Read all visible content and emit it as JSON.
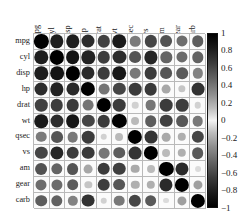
{
  "chart_data": {
    "type": "heatmap",
    "title": "",
    "subtitle": "",
    "xlabel": "",
    "ylabel": "",
    "grid": true,
    "legend_position": "right",
    "style": "corrplot-circle-grayscale",
    "note": "Correlation matrix of the mtcars variables. Circle area and darkness encode absolute correlation; the gray scale is symmetric so that both +1 and -1 render black and 0 renders near-white.",
    "categories": [
      "mpg",
      "cyl",
      "disp",
      "hp",
      "drat",
      "wt",
      "qsec",
      "vs",
      "am",
      "gear",
      "carb"
    ],
    "x_tick_labels": [
      "mpg",
      "cyl",
      "disp",
      "hp",
      "drat",
      "wt",
      "qsec",
      "vs",
      "am",
      "gear",
      "carb"
    ],
    "y_tick_labels": [
      "mpg",
      "cyl",
      "disp",
      "hp",
      "drat",
      "wt",
      "qsec",
      "vs",
      "am",
      "gear",
      "carb"
    ],
    "zlim": [
      -1,
      1
    ],
    "colorbar": {
      "ticks": [
        "1",
        "0.8",
        "0.6",
        "0.4",
        "0.2",
        "0",
        "−0.2",
        "−0.4",
        "−0.6",
        "−0.8",
        "−1"
      ],
      "tick_values": [
        1,
        0.8,
        0.6,
        0.4,
        0.2,
        0,
        -0.2,
        -0.4,
        -0.6,
        -0.8,
        -1
      ],
      "top_color": "#000000",
      "mid_color": "#f2f2f2",
      "bottom_color": "#000000"
    },
    "matrix": [
      [
        1.0,
        -0.85,
        -0.85,
        -0.78,
        0.68,
        -0.87,
        0.42,
        0.66,
        0.6,
        0.48,
        -0.55
      ],
      [
        -0.85,
        1.0,
        0.9,
        0.83,
        -0.7,
        0.78,
        -0.59,
        -0.81,
        -0.52,
        -0.49,
        0.53
      ],
      [
        -0.85,
        0.9,
        1.0,
        0.79,
        -0.71,
        0.89,
        -0.43,
        -0.71,
        -0.59,
        -0.56,
        0.39
      ],
      [
        -0.78,
        0.83,
        0.79,
        1.0,
        -0.45,
        0.66,
        -0.71,
        -0.72,
        -0.24,
        -0.13,
        0.75
      ],
      [
        0.68,
        -0.7,
        -0.71,
        -0.45,
        1.0,
        -0.71,
        0.09,
        0.44,
        0.71,
        0.7,
        -0.09
      ],
      [
        -0.87,
        0.78,
        0.89,
        0.66,
        -0.71,
        1.0,
        -0.17,
        -0.55,
        -0.69,
        -0.58,
        0.43
      ],
      [
        0.42,
        -0.59,
        -0.43,
        -0.71,
        0.09,
        -0.17,
        1.0,
        0.74,
        -0.23,
        -0.21,
        -0.66
      ],
      [
        0.66,
        -0.81,
        -0.71,
        -0.72,
        0.44,
        -0.55,
        0.74,
        1.0,
        0.17,
        0.21,
        -0.57
      ],
      [
        0.6,
        -0.52,
        -0.59,
        -0.24,
        0.71,
        -0.69,
        -0.23,
        0.17,
        1.0,
        0.79,
        0.06
      ],
      [
        0.48,
        -0.49,
        -0.56,
        -0.13,
        0.7,
        -0.58,
        -0.21,
        0.21,
        0.79,
        1.0,
        0.27
      ],
      [
        -0.55,
        0.53,
        0.39,
        0.75,
        -0.09,
        0.43,
        -0.66,
        -0.57,
        0.06,
        0.27,
        1.0
      ]
    ]
  },
  "plot": {
    "background_color": "#ffffff",
    "grid_line_color": "#b9b9b9",
    "cell_fill_color": "#fbfbfb"
  }
}
